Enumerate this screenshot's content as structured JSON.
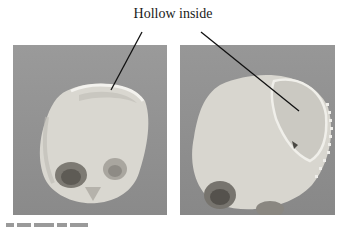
{
  "figure": {
    "annotation_label": "Hollow inside",
    "panels": [
      {
        "id": "left",
        "description": "3D rendering of skull, frontal-oblique view, with hollow cranial interior visible at top"
      },
      {
        "id": "right",
        "description": "3D rendering of skull, top-oblique view, with hollow cranial interior and serrated edge visible"
      }
    ],
    "colors": {
      "panel_background": "#8f8f8f",
      "skull": "#d8d6cf",
      "arrow": "#111111"
    },
    "caption_partial": ""
  }
}
